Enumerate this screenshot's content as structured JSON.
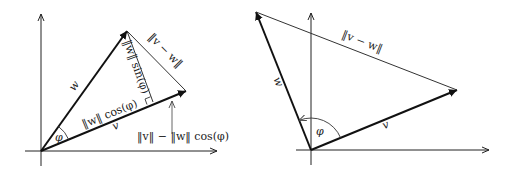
{
  "left_diagram": {
    "labels": {
      "w": "w",
      "v": "v",
      "v_minus_w": "‖v − w‖",
      "w_sin": "‖w‖ sin(φ)",
      "w_cos": "‖w‖ cos(φ)",
      "phi": "φ",
      "v_minus_wcos": "‖v‖ − ‖w‖ cos(φ)"
    }
  },
  "right_diagram": {
    "labels": {
      "w": "w",
      "v": "v",
      "v_minus_w": "‖v − w‖",
      "phi": "φ"
    }
  },
  "colors": {
    "line": "#1a1a1a",
    "thin_line": "#444444",
    "background": "#ffffff"
  }
}
